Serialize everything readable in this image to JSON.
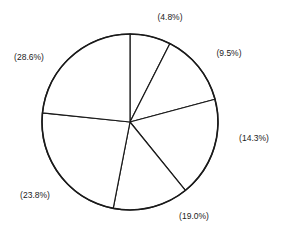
{
  "chart_data": {
    "type": "pie",
    "title": "",
    "center": [
      130,
      122
    ],
    "radius": 88,
    "stroke_color": "#1a1a1a",
    "fill_color": "#ffffff",
    "slices": [
      {
        "label": "(4.8%)",
        "value": 4.8,
        "start_deg": 0,
        "end_deg": 27,
        "label_pos": [
          170,
          20
        ]
      },
      {
        "label": "(9.5%)",
        "value": 9.5,
        "start_deg": 27,
        "end_deg": 75,
        "label_pos": [
          229,
          56
        ]
      },
      {
        "label": "(14.3%)",
        "value": 14.3,
        "start_deg": 75,
        "end_deg": 141,
        "label_pos": [
          254,
          141
        ]
      },
      {
        "label": "(19.0%)",
        "value": 19.0,
        "start_deg": 141,
        "end_deg": 191,
        "label_pos": [
          194,
          219
        ]
      },
      {
        "label": "(23.8%)",
        "value": 23.8,
        "start_deg": 191,
        "end_deg": 276,
        "label_pos": [
          35,
          198
        ]
      },
      {
        "label": "(28.6%)",
        "value": 28.6,
        "start_deg": 276,
        "end_deg": 360,
        "label_pos": [
          29,
          60
        ]
      }
    ],
    "categories": [
      "(4.8%)",
      "(9.5%)",
      "(14.3%)",
      "(19.0%)",
      "(23.8%)",
      "(28.6%)"
    ],
    "values": [
      4.8,
      9.5,
      14.3,
      19.0,
      23.8,
      28.6
    ],
    "legend": "none"
  }
}
